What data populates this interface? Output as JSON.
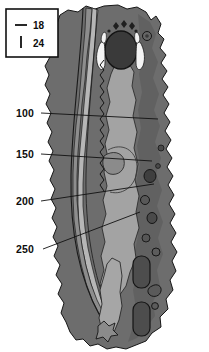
{
  "figure": {
    "width": 209,
    "height": 352,
    "background_color": "#ffffff"
  },
  "legend": {
    "name": "scale-legend",
    "box": {
      "x": 6,
      "y": 9,
      "width": 52,
      "height": 48
    },
    "entries": [
      {
        "label": "18",
        "marker": "horizontal-line",
        "marker_orientation": "horizontal",
        "color": "#111111"
      },
      {
        "label": "24",
        "marker": "vertical-line",
        "marker_orientation": "vertical",
        "color": "#111111"
      }
    ]
  },
  "callouts": [
    {
      "label": "100",
      "label_x": 16,
      "label_y": 117,
      "leader_from": {
        "x": 41,
        "y": 113
      },
      "leader_to": {
        "x": 158,
        "y": 119
      }
    },
    {
      "label": "150",
      "label_x": 16,
      "label_y": 158,
      "leader_from": {
        "x": 41,
        "y": 154
      },
      "leader_to": {
        "x": 152,
        "y": 161
      }
    },
    {
      "label": "200",
      "label_x": 16,
      "label_y": 205,
      "leader_from": {
        "x": 41,
        "y": 201
      },
      "leader_to": {
        "x": 154,
        "y": 184
      }
    },
    {
      "label": "250",
      "label_x": 16,
      "label_y": 253,
      "leader_from": {
        "x": 43,
        "y": 249
      },
      "leader_to": {
        "x": 140,
        "y": 212
      }
    }
  ],
  "colors": {
    "background": "#ffffff",
    "outer_tissue": "#6f6f6f",
    "mid_tissue": "#5d5d5d",
    "inner_core": "#a0a0a0",
    "channel_light": "#8e8e8e",
    "channel_pale": "#b4b4b4",
    "dark_feature": "#3c3c3c",
    "bright_feature": "#f2f2f2",
    "outline": "#161616",
    "text": "#0d0d0d"
  },
  "regions": [
    {
      "name": "outer-tissue-mass",
      "tone": "mid-gray",
      "description": "irregular lobed outer body"
    },
    {
      "name": "inner-core-column",
      "tone": "light-gray",
      "description": "elongated central light column"
    },
    {
      "name": "left-channel-band",
      "tone": "pale-gray",
      "description": "vertical banded channel at left"
    },
    {
      "name": "upper-cavity",
      "tone": "dark-gray",
      "description": "rounded dark cavity near top"
    },
    {
      "name": "bright-lobes",
      "tone": "near-white",
      "description": "paired bright lobes flanking cavity"
    },
    {
      "name": "lower-dark-nodules",
      "tone": "dark-gray",
      "description": "oval dark nodules in lower right"
    }
  ]
}
